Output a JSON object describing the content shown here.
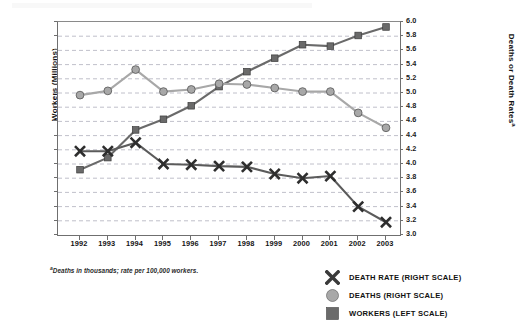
{
  "axes": {
    "left_title": "Workers (Millions)",
    "right_title": "Deaths or Death Rates",
    "right_title_sup": "a",
    "left_ticks": [
      "140",
      "138",
      "136",
      "134",
      "132",
      "130",
      "128",
      "126",
      "124",
      "122",
      "120",
      "118",
      "116",
      "114",
      "112",
      "110"
    ],
    "right_ticks": [
      "6.0",
      "5.8",
      "5.6",
      "5.4",
      "5.2",
      "5.0",
      "4.8",
      "4.6",
      "4.4",
      "4.2",
      "4.0",
      "3.8",
      "3.6",
      "3.4",
      "3.2",
      "3.0"
    ],
    "x_ticks": [
      "1992",
      "1993",
      "1994",
      "1995",
      "1996",
      "1997",
      "1998",
      "1999",
      "2000",
      "2001",
      "2002",
      "2003"
    ]
  },
  "footnote": {
    "sup": "a",
    "text": "Deaths in thousands; rate per 100,000 workers."
  },
  "legend": {
    "items": [
      {
        "label": "DEATH RATE (RIGHT SCALE)",
        "marker": "x-marker-icon",
        "color": "#5b5b5b"
      },
      {
        "label": "DEATHS (RIGHT SCALE)",
        "marker": "circle-marker-icon",
        "color": "#a8a8a8"
      },
      {
        "label": "WORKERS (LEFT SCALE)",
        "marker": "square-marker-icon",
        "color": "#6a6a6a"
      }
    ]
  },
  "chart_data": {
    "type": "line",
    "title": "",
    "xlabel": "",
    "ylabel": "Workers (Millions)",
    "y2label": "Deaths or Death Rates",
    "grid": true,
    "legend_position": "bottom-right",
    "x": [
      1992,
      1993,
      1994,
      1995,
      1996,
      1997,
      1998,
      1999,
      2000,
      2001,
      2002,
      2003
    ],
    "ylim": [
      110,
      140
    ],
    "ytick_step": 2,
    "y2lim": [
      3.0,
      6.0
    ],
    "y2tick_step": 0.2,
    "series": [
      {
        "name": "WORKERS (LEFT SCALE)",
        "axis": "left",
        "marker": "square",
        "color": "#6a6a6a",
        "values": [
          119.2,
          120.9,
          124.8,
          126.3,
          128.2,
          130.9,
          133.0,
          134.9,
          136.8,
          136.6,
          138.1,
          139.3
        ]
      },
      {
        "name": "DEATHS (RIGHT SCALE)",
        "axis": "right",
        "marker": "circle",
        "color": "#a8a8a8",
        "values": [
          4.97,
          5.03,
          5.33,
          5.02,
          5.05,
          5.13,
          5.12,
          5.07,
          5.02,
          5.02,
          4.72,
          4.51
        ]
      },
      {
        "name": "DEATH RATE (RIGHT SCALE)",
        "axis": "right",
        "marker": "x",
        "color": "#5b5b5b",
        "values": [
          4.18,
          4.18,
          4.3,
          4.0,
          3.99,
          3.97,
          3.96,
          3.86,
          3.8,
          3.83,
          3.4,
          3.18
        ]
      }
    ]
  }
}
